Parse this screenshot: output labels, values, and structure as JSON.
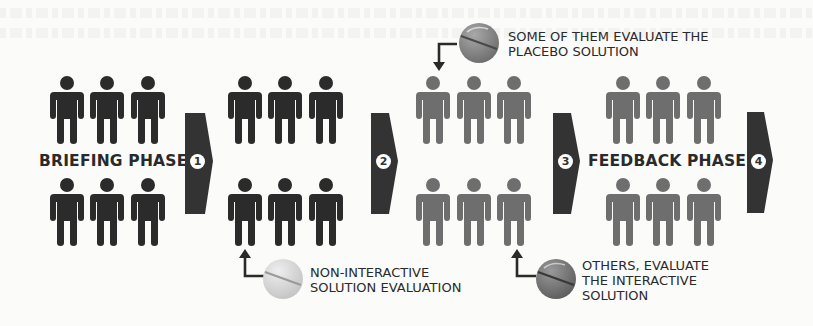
{
  "diagram": {
    "type": "process-flow",
    "colors": {
      "participant_active": "#2b2b2b",
      "participant_evaluated": "#6e6e6e",
      "arrow": "#333333",
      "text": "#2a2a2a",
      "pill_placebo": "#8a8a8a",
      "pill_interactive": "#6e6e6e",
      "pill_noninteractive": "#d2d2d2"
    },
    "phases": [
      {
        "label": "BRIEFING PHASE",
        "step": "1",
        "participants": 6,
        "color": "dark"
      },
      {
        "label": "",
        "step": "2",
        "participants": 6,
        "color": "dark"
      },
      {
        "label": "",
        "step": "3",
        "participants": 6,
        "color": "gray"
      },
      {
        "label": "FEEDBACK PHASE",
        "step": "4",
        "participants": 6,
        "color": "gray"
      }
    ],
    "annotations": {
      "noninteractive": {
        "text": "NON-INTERACTIVE\nSOLUTION EVALUATION",
        "icon": "pill-light-icon"
      },
      "placebo": {
        "text": "SOME OF THEM EVALUATE THE\nPLACEBO SOLUTION",
        "icon": "pill-medium-icon"
      },
      "interactive": {
        "text": "OTHERS, EVALUATE\nTHE INTERACTIVE\nSOLUTION",
        "icon": "pill-dark-icon"
      }
    }
  }
}
